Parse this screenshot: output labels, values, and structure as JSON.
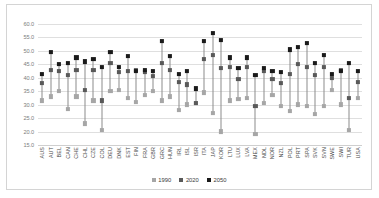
{
  "chart_data": {
    "type": "scatter",
    "title": "",
    "xlabel": "",
    "ylabel": "",
    "ylim": [
      15.0,
      60.0
    ],
    "ytick_step": 5.0,
    "yticks": [
      "60.0",
      "55.0",
      "50.0",
      "45.0",
      "40.0",
      "35.0",
      "30.0",
      "25.0",
      "20.0",
      "15.0"
    ],
    "grid": true,
    "legend_position": "bottom",
    "legend": [
      "1990",
      "2020",
      "2050"
    ],
    "series_colors": {
      "1990": "#a6a6a6",
      "2020": "#595959",
      "2050": "#1a1a1a"
    },
    "categories": [
      "AUS",
      "AUT",
      "BEL",
      "CAN",
      "CHE",
      "CHL",
      "CZE",
      "COL",
      "DEU",
      "DNK",
      "EST",
      "FIN",
      "FRA",
      "GBR",
      "GRC",
      "HUN",
      "IRL",
      "ISL",
      "ISR",
      "ITA",
      "JAP",
      "KOR",
      "LTU",
      "LUX",
      "LVA",
      "MEX",
      "NDL",
      "NOR",
      "NZL",
      "POL",
      "PRT",
      "SPA",
      "SVK",
      "SVN",
      "SWE",
      "SWI",
      "TUR",
      "USA"
    ],
    "series": [
      {
        "name": "1990",
        "values": [
          31.5,
          33.0,
          35.0,
          28.5,
          33.0,
          23.0,
          31.5,
          20.5,
          35.0,
          35.5,
          32.5,
          31.0,
          33.5,
          35.0,
          31.5,
          33.0,
          28.0,
          30.0,
          30.5,
          34.5,
          27.0,
          20.0,
          31.5,
          32.0,
          32.5,
          19.0,
          30.5,
          33.5,
          29.5,
          27.5,
          30.0,
          29.5,
          26.5,
          29.5,
          35.5,
          30.0,
          20.5,
          32.5
        ]
      },
      {
        "name": "2020",
        "values": [
          38.0,
          43.0,
          42.5,
          41.0,
          43.0,
          35.5,
          43.0,
          31.5,
          45.5,
          42.0,
          42.5,
          43.0,
          42.0,
          40.5,
          45.5,
          43.0,
          38.5,
          37.5,
          30.5,
          47.0,
          48.5,
          43.5,
          44.0,
          39.5,
          44.0,
          29.5,
          42.5,
          39.5,
          38.0,
          41.5,
          45.0,
          44.0,
          41.0,
          44.0,
          40.0,
          43.0,
          32.5,
          38.5
        ]
      },
      {
        "name": "2050",
        "values": [
          41.5,
          49.5,
          45.0,
          45.5,
          47.5,
          46.0,
          47.0,
          44.0,
          49.5,
          44.0,
          48.0,
          42.5,
          43.0,
          42.5,
          53.5,
          48.0,
          41.5,
          42.5,
          36.0,
          53.5,
          56.5,
          54.0,
          47.5,
          43.5,
          47.5,
          41.0,
          43.5,
          42.5,
          42.0,
          50.5,
          51.5,
          53.0,
          45.5,
          48.5,
          41.5,
          42.5,
          45.5,
          42.5
        ]
      }
    ]
  }
}
